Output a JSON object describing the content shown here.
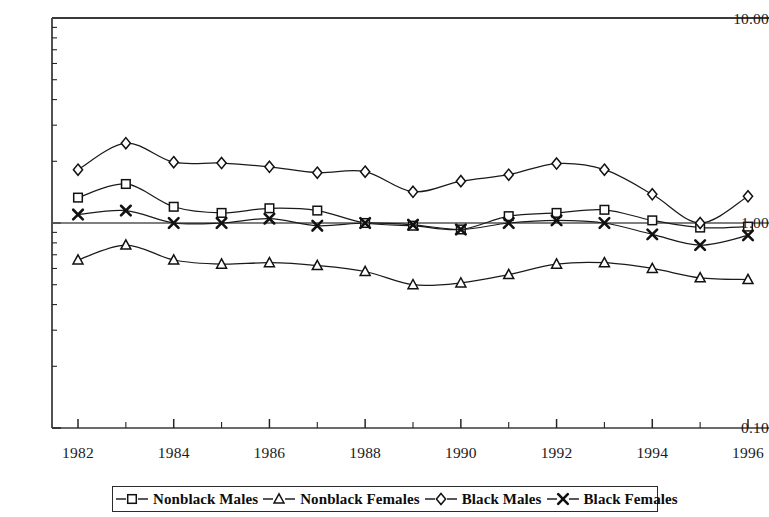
{
  "chart_data": {
    "type": "line",
    "title": "",
    "subtitle": "",
    "xlabel": "",
    "ylabel": "",
    "yscale": "log",
    "ylim": [
      0.1,
      10.0
    ],
    "xlim": [
      1982,
      1996
    ],
    "grid": false,
    "reference_line": 1.0,
    "legend_position": "bottom",
    "y_tick_labels": [
      "10.00",
      "1.00",
      "0.10"
    ],
    "y_tick_values": [
      10.0,
      1.0,
      0.1
    ],
    "x_tick_labels": [
      "1982",
      "1984",
      "1986",
      "1988",
      "1990",
      "1992",
      "1994",
      "1996"
    ],
    "x_tick_values": [
      1982,
      1984,
      1986,
      1988,
      1990,
      1992,
      1994,
      1996
    ],
    "x_minor_ticks": [
      1983,
      1985,
      1987,
      1989,
      1991,
      1993,
      1995
    ],
    "x": [
      1982,
      1983,
      1984,
      1985,
      1986,
      1987,
      1988,
      1989,
      1990,
      1991,
      1992,
      1993,
      1994,
      1995,
      1996
    ],
    "series": [
      {
        "name": "Nonblack Males",
        "marker": "square",
        "linestyle": "solid",
        "color": "#1a1a1a",
        "values": [
          1.33,
          1.55,
          1.2,
          1.12,
          1.18,
          1.15,
          1.0,
          0.97,
          0.93,
          1.08,
          1.12,
          1.16,
          1.03,
          0.95,
          0.96
        ]
      },
      {
        "name": "Nonblack Females",
        "marker": "triangle",
        "linestyle": "dashed",
        "color": "#1a1a1a",
        "values": [
          0.66,
          0.78,
          0.66,
          0.63,
          0.64,
          0.62,
          0.58,
          0.5,
          0.51,
          0.56,
          0.63,
          0.64,
          0.6,
          0.54,
          0.53
        ]
      },
      {
        "name": "Black Males",
        "marker": "diamond",
        "linestyle": "dashed",
        "color": "#1a1a1a",
        "values": [
          1.82,
          2.45,
          1.98,
          1.96,
          1.88,
          1.76,
          1.78,
          1.42,
          1.6,
          1.72,
          1.95,
          1.82,
          1.38,
          1.0,
          1.35
        ]
      },
      {
        "name": "Black Females",
        "marker": "cross",
        "linestyle": "dashed",
        "color": "#1a1a1a",
        "values": [
          1.1,
          1.15,
          1.0,
          1.0,
          1.05,
          0.97,
          1.0,
          0.98,
          0.93,
          1.0,
          1.03,
          1.0,
          0.88,
          0.78,
          0.87
        ]
      }
    ]
  },
  "axis": {
    "y_top_label": "10.00",
    "y_mid_label": "1.00",
    "y_bottom_label": "0.10"
  },
  "legend": {
    "items": [
      {
        "label": "Nonblack Males",
        "marker": "square"
      },
      {
        "label": "Nonblack Females",
        "marker": "triangle"
      },
      {
        "label": "Black Males",
        "marker": "diamond"
      },
      {
        "label": "Black Females",
        "marker": "cross"
      }
    ]
  }
}
